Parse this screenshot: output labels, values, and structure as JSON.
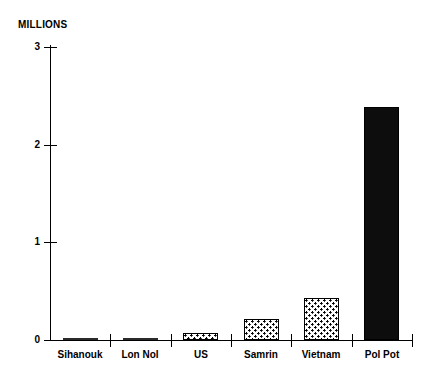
{
  "chart_data": {
    "type": "bar",
    "title": "",
    "subtitle": "",
    "xlabel": "",
    "ylabel": "MILLIONS",
    "unit_label": "MILLIONS",
    "categories": [
      "Sihanouk",
      "Lon Nol",
      "US",
      "Samrin",
      "Vietnam",
      "Pol Pot"
    ],
    "values": [
      0.01,
      0.02,
      0.07,
      0.22,
      0.43,
      2.39
    ],
    "ylim": [
      0,
      3
    ],
    "yticks": [
      0,
      1,
      2,
      3
    ],
    "ytick_labels": [
      "0",
      "1",
      "2",
      "3"
    ],
    "grid": false,
    "legend": null,
    "bar_styles": [
      "flat",
      "flat",
      "stipple",
      "stipple",
      "stipple",
      "solid"
    ],
    "colors": {
      "axis": "#000000",
      "text": "#000000",
      "solid_bar": "#0d0d0d",
      "stipple_bar_fill": "#ffffff",
      "stipple_bar_outline": "#000000",
      "flat_bar": "#2b2b2b",
      "background": "#ffffff"
    }
  }
}
